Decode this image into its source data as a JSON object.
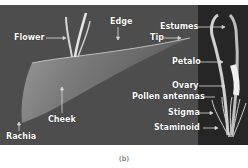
{
  "figure": {
    "labels": {
      "flower": "Flower",
      "edge": "Edge",
      "estumes": "Estumes",
      "tip": "Tip",
      "petalo": "Petalo",
      "ovary": "Ovary",
      "pollen_antennas": "Pollen antennas",
      "stigma": "Stigma",
      "staminoid": "Staminoid",
      "cheek": "Cheek",
      "rachia": "Rachia"
    },
    "caption": "(b)",
    "colors": {
      "left_background": "#4d4d4d",
      "right_background": "#262626",
      "label_text": "#ffffff",
      "arrow": "#d9d9d9"
    }
  }
}
